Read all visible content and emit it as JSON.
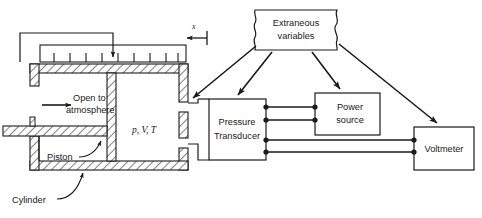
{
  "diagram": {
    "type": "schematic-block-diagram",
    "stroke_color": "#1a1a1a",
    "background_color": "#ffffff",
    "apparatus": {
      "displacement_label": "x",
      "state_variables_label": "p, V, T",
      "open_to_atmosphere_label_line1": "Open to",
      "open_to_atmosphere_label_line2": "atmosphere",
      "piston_label": "Piston",
      "cylinder_label": "Cylinder",
      "scale_tick_count": 9
    },
    "blocks": [
      {
        "id": "extraneous-variables",
        "label_line1": "Extraneous",
        "label_line2": "variables",
        "shape": "wavy-sided-rectangle",
        "x": 255,
        "y": 10,
        "w": 82,
        "h": 40
      },
      {
        "id": "pressure-transducer",
        "label_line1": "Pressure",
        "label_line2": "Transducer",
        "shape": "rectangle",
        "x": 209,
        "y": 99,
        "w": 57,
        "h": 61
      },
      {
        "id": "power-source",
        "label_line1": "Power",
        "label_line2": "source",
        "shape": "rectangle",
        "x": 315,
        "y": 93,
        "w": 65,
        "h": 42
      },
      {
        "id": "voltmeter",
        "label_line1": "Voltmeter",
        "label_line2": "",
        "shape": "rectangle",
        "x": 414,
        "y": 127,
        "w": 60,
        "h": 43
      }
    ],
    "wires": [
      {
        "from": "pressure-transducer",
        "to": "power-source",
        "terminal": 1
      },
      {
        "from": "pressure-transducer",
        "to": "power-source",
        "terminal": 2
      },
      {
        "from": "pressure-transducer",
        "to": "voltmeter",
        "terminal": 3
      },
      {
        "from": "pressure-transducer",
        "to": "voltmeter",
        "terminal": 4
      }
    ],
    "influence_arrows": [
      {
        "from": "extraneous-variables",
        "to": "cylinder-assembly"
      },
      {
        "from": "extraneous-variables",
        "to": "pressure-transducer"
      },
      {
        "from": "extraneous-variables",
        "to": "power-source"
      },
      {
        "from": "extraneous-variables",
        "to": "voltmeter"
      }
    ]
  }
}
